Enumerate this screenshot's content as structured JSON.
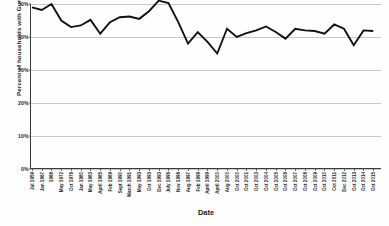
{
  "chart_data": {
    "type": "line",
    "title": "",
    "xlabel": "Date",
    "ylabel": "Percent of households with Guns",
    "ylim": [
      0,
      50
    ],
    "ytick_labels": [
      "0%",
      "10%",
      "20%",
      "30%",
      "40%",
      "50%"
    ],
    "ytick_values": [
      0,
      10,
      20,
      30,
      40,
      50
    ],
    "grid": true,
    "legend": "none",
    "line_color": "#111111",
    "grid_color": "#c9c9c9",
    "categories": [
      "Jul 1959",
      "Jan 1967",
      "1968",
      "May 1972",
      "Oct 1976",
      "Jan 1980",
      "May 1983",
      "April 1985",
      "Feb 1989",
      "Sept 1990",
      "March 1991",
      "May 1993",
      "Oct 1993",
      "Dec 1993",
      "July 1996",
      "Nov 1996",
      "Aug 1997",
      "Feb 1999",
      "April 1999",
      "April 2000",
      "Aug 2000",
      "Oct 2000",
      "Oct 2001",
      "Oct 2003",
      "Oct 2004",
      "Oct 2005",
      "Oct 2006",
      "Oct 2007",
      "Oct 2008",
      "Oct 2009",
      "Oct 2010",
      "Oct 2011",
      "Dec 2012",
      "Oct 2013",
      "Oct 2014",
      "Oct 2015"
    ],
    "values": [
      49.0,
      48.2,
      50.0,
      45.0,
      43.0,
      43.5,
      45.2,
      41.0,
      44.5,
      46.0,
      46.2,
      45.5,
      47.8,
      51.0,
      50.3,
      44.5,
      38.0,
      41.5,
      38.5,
      35.0,
      42.5,
      40.0,
      41.2,
      42.0,
      43.2,
      41.5,
      39.5,
      42.5,
      42.0,
      41.8,
      41.0,
      43.8,
      42.5,
      37.5,
      42.0,
      41.8
    ],
    "series": [
      {
        "name": "Percent of households with Guns",
        "values": [
          49.0,
          48.2,
          50.0,
          45.0,
          43.0,
          43.5,
          45.2,
          41.0,
          44.5,
          46.0,
          46.2,
          45.5,
          47.8,
          51.0,
          50.3,
          44.5,
          38.0,
          41.5,
          38.5,
          35.0,
          42.5,
          40.0,
          41.2,
          42.0,
          43.2,
          41.5,
          39.5,
          42.5,
          42.0,
          41.8,
          41.0,
          43.8,
          42.5,
          37.5,
          42.0,
          41.8
        ]
      }
    ]
  }
}
